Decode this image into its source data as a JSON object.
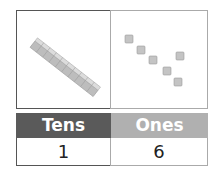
{
  "place_value_chart": {
    "tens": {
      "label": "Tens",
      "value": "1",
      "blocks": "ten-rod",
      "count": 1
    },
    "ones": {
      "label": "Ones",
      "value": "6",
      "blocks": "unit-cubes",
      "count": 6
    }
  },
  "colors": {
    "tens_header": "#5a5a5a",
    "ones_header": "#b0b0b0",
    "block": "#c8c8c8"
  }
}
